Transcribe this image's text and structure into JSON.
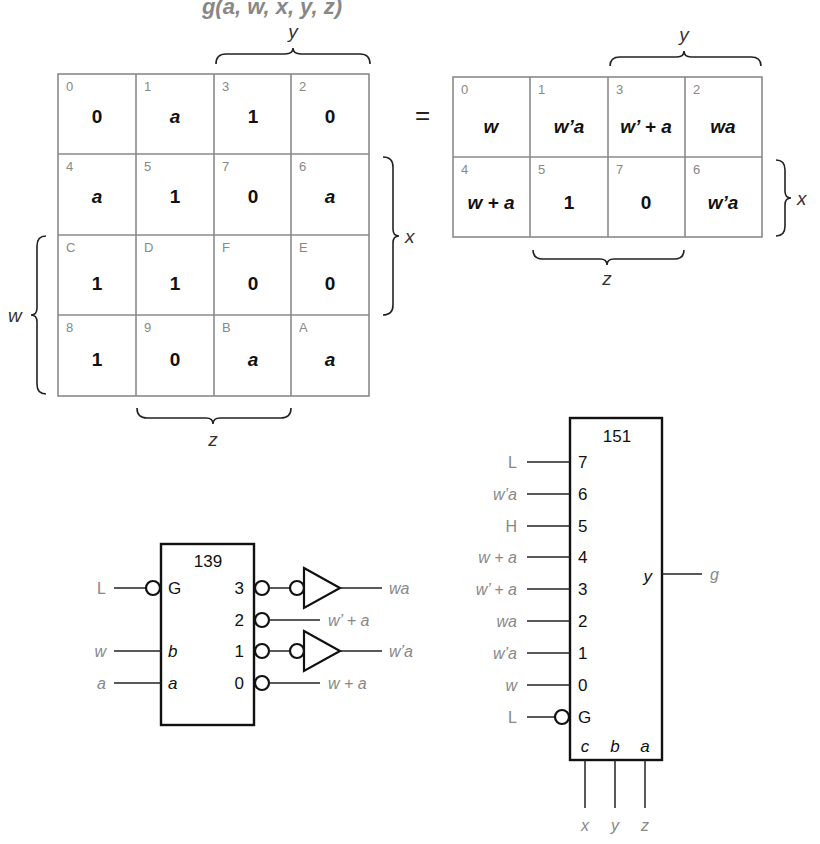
{
  "title": "g(a, w, x, y, z)",
  "equals": "=",
  "left_map": {
    "var_labels": {
      "y": "y",
      "x": "x",
      "w": "w",
      "z": "z"
    },
    "cells": [
      [
        {
          "idx": "0",
          "val": "0",
          "it": false
        },
        {
          "idx": "1",
          "val": "a",
          "it": true
        },
        {
          "idx": "3",
          "val": "1",
          "it": false
        },
        {
          "idx": "2",
          "val": "0",
          "it": false
        }
      ],
      [
        {
          "idx": "4",
          "val": "a",
          "it": true
        },
        {
          "idx": "5",
          "val": "1",
          "it": false
        },
        {
          "idx": "7",
          "val": "0",
          "it": false
        },
        {
          "idx": "6",
          "val": "a",
          "it": true
        }
      ],
      [
        {
          "idx": "C",
          "val": "1",
          "it": false
        },
        {
          "idx": "D",
          "val": "1",
          "it": false
        },
        {
          "idx": "F",
          "val": "0",
          "it": false
        },
        {
          "idx": "E",
          "val": "0",
          "it": false
        }
      ],
      [
        {
          "idx": "8",
          "val": "1",
          "it": false
        },
        {
          "idx": "9",
          "val": "0",
          "it": false
        },
        {
          "idx": "B",
          "val": "a",
          "it": true
        },
        {
          "idx": "A",
          "val": "a",
          "it": true
        }
      ]
    ]
  },
  "right_map": {
    "var_labels": {
      "y": "y",
      "x": "x",
      "z": "z"
    },
    "cells": [
      [
        {
          "idx": "0",
          "val": "w"
        },
        {
          "idx": "1",
          "val": "w’a"
        },
        {
          "idx": "3",
          "val": "w’ + a"
        },
        {
          "idx": "2",
          "val": "wa"
        }
      ],
      [
        {
          "idx": "4",
          "val": "w + a"
        },
        {
          "idx": "5",
          "val": "1"
        },
        {
          "idx": "7",
          "val": "0"
        },
        {
          "idx": "6",
          "val": "w’a"
        }
      ]
    ]
  },
  "decoder_139": {
    "label": "139",
    "inputs": [
      {
        "signal": "L",
        "pin": "G",
        "negated": true
      },
      {
        "signal": "w",
        "pin": "b",
        "negated": false
      },
      {
        "signal": "a",
        "pin": "a",
        "negated": false
      }
    ],
    "outputs": [
      {
        "pin": "3",
        "signal": "wa",
        "inverter": true
      },
      {
        "pin": "2",
        "signal": "w’ + a",
        "inverter": false
      },
      {
        "pin": "1",
        "signal": "w’a",
        "inverter": true
      },
      {
        "pin": "0",
        "signal": "w + a",
        "inverter": false
      }
    ]
  },
  "mux_151": {
    "label": "151",
    "data_inputs": [
      {
        "pin": "7",
        "signal": "L"
      },
      {
        "pin": "6",
        "signal": "w’a"
      },
      {
        "pin": "5",
        "signal": "H"
      },
      {
        "pin": "4",
        "signal": "w + a"
      },
      {
        "pin": "3",
        "signal": "w’ + a"
      },
      {
        "pin": "2",
        "signal": "wa"
      },
      {
        "pin": "1",
        "signal": "w’a"
      },
      {
        "pin": "0",
        "signal": "w"
      }
    ],
    "enable": {
      "pin": "G",
      "signal": "L",
      "negated": true
    },
    "select": [
      {
        "pin": "c",
        "signal": "x"
      },
      {
        "pin": "b",
        "signal": "y"
      },
      {
        "pin": "a",
        "signal": "z"
      }
    ],
    "output": {
      "pin": "y",
      "signal": "g"
    }
  }
}
